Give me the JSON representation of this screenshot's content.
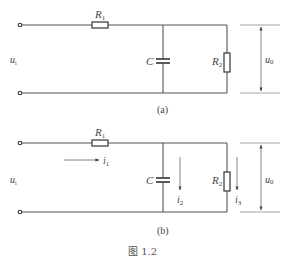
{
  "figure": {
    "caption": "图 1.2"
  },
  "circuit_a": {
    "caption": "(a)",
    "input_label": "u",
    "input_sub": "i",
    "output_label": "u",
    "output_sub": "0",
    "r1_label": "R",
    "r1_sub": "1",
    "c_label": "C",
    "r2_label": "R",
    "r2_sub": "2"
  },
  "circuit_b": {
    "caption": "(b)",
    "input_label": "u",
    "input_sub": "i",
    "output_label": "u",
    "output_sub": "0",
    "r1_label": "R",
    "r1_sub": "1",
    "c_label": "C",
    "r2_label": "R",
    "r2_sub": "2",
    "i1_label": "i",
    "i1_sub": "1",
    "i2_label": "i",
    "i2_sub": "2",
    "i3_label": "i",
    "i3_sub": "3"
  }
}
